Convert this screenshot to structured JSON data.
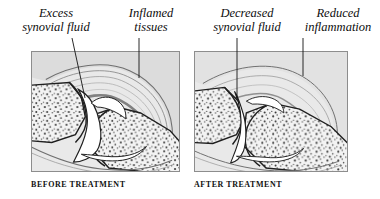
{
  "figure": {
    "type": "medical-illustration",
    "background_color": "#ffffff",
    "panel_fill": "#e9e9e9",
    "panel_border": "#8d8d8d",
    "ink_color": "#1a1a1a"
  },
  "labels": {
    "excess_fluid": "Excess\nsynovial fluid",
    "inflamed_tissues": "Inflamed\ntissues",
    "decreased_fluid": "Decreased\nsynovial fluid",
    "reduced_inflammation": "Reduced\ninflammation"
  },
  "captions": {
    "before": "BEFORE TREATMENT",
    "after": "AFTER TREATMENT"
  },
  "panels": [
    {
      "id": "before",
      "caption": "BEFORE TREATMENT",
      "joint_space": "wide",
      "capsule_layers": 5,
      "annotations": [
        "Excess synovial fluid",
        "Inflamed tissues"
      ]
    },
    {
      "id": "after",
      "caption": "AFTER TREATMENT",
      "joint_space": "narrow",
      "capsule_layers": 3,
      "annotations": [
        "Decreased synovial fluid",
        "Reduced inflammation"
      ]
    }
  ]
}
